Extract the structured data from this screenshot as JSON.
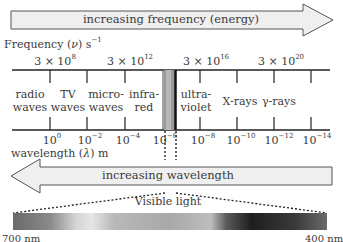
{
  "top_arrow": {
    "label": "increasing frequency (energy)",
    "direction": "right",
    "fill": "#efefef"
  },
  "frequency_axis": {
    "label_prefix": "Frequency (",
    "label_symbol": "ν",
    "label_suffix": ") s",
    "label_exp": "−1",
    "values": [
      {
        "base": "3 × 10",
        "exp": "8"
      },
      {
        "base": "3 × 10",
        "exp": "12"
      },
      {
        "base": "3 × 10",
        "exp": "16"
      },
      {
        "base": "3 × 10",
        "exp": "20"
      }
    ]
  },
  "regions": [
    {
      "line1": "radio",
      "line2": "waves"
    },
    {
      "line1": "TV",
      "line2": "waves"
    },
    {
      "line1": "micro-",
      "line2": "waves"
    },
    {
      "line1": "infra-",
      "line2": "red"
    },
    {
      "line1": "ultra-",
      "line2": "violet"
    },
    {
      "line1": "X-rays",
      "line2": ""
    },
    {
      "line1": "γ-rays",
      "line2": ""
    }
  ],
  "wavelength_axis": {
    "label_prefix": "wavelength (",
    "label_symbol": "λ",
    "label_suffix": ") m",
    "values": [
      {
        "base": "10",
        "exp": "0"
      },
      {
        "base": "10",
        "exp": "−2"
      },
      {
        "base": "10",
        "exp": "−4"
      },
      {
        "base": "10",
        "exp": "−6"
      },
      {
        "base": "10",
        "exp": "−8"
      },
      {
        "base": "10",
        "exp": "−10"
      },
      {
        "base": "10",
        "exp": "−12"
      },
      {
        "base": "10",
        "exp": "−14"
      }
    ]
  },
  "bottom_arrow": {
    "label": "increasing wavelength",
    "direction": "left",
    "fill": "#efefef"
  },
  "visible_light": {
    "label": "Visible light",
    "left_label": "700 nm",
    "right_label": "400 nm"
  }
}
